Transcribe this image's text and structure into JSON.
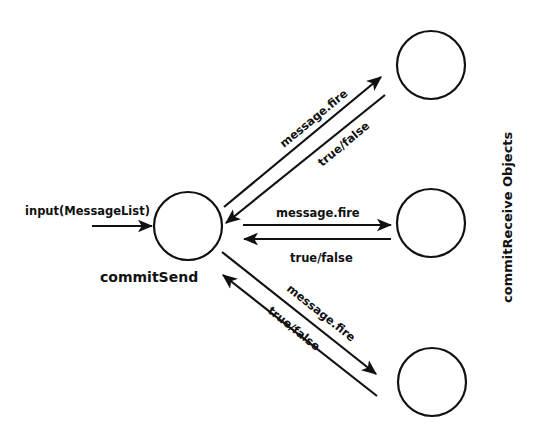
{
  "diagram": {
    "title_label": "commitReceive Objects",
    "sender": {
      "label": "commitSend",
      "input_label": "input(MessageList)"
    },
    "receivers": [
      {
        "name": "receiver-top"
      },
      {
        "name": "receiver-middle"
      },
      {
        "name": "receiver-bottom"
      }
    ],
    "edges": {
      "top": {
        "request": "message.fire",
        "response": "true/false"
      },
      "middle": {
        "request": "message.fire",
        "response": "true/false"
      },
      "bottom": {
        "request": "message.fire",
        "response": "true/false"
      }
    },
    "colors": {
      "stroke": "#111111",
      "background": "#ffffff"
    }
  }
}
